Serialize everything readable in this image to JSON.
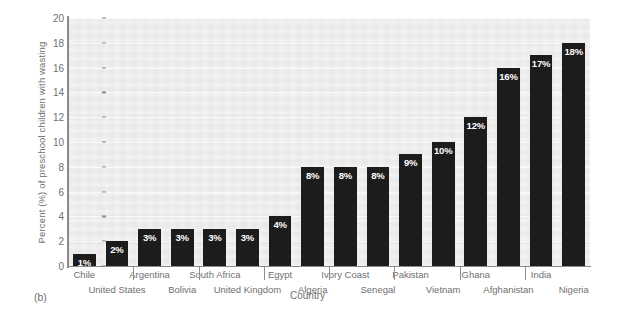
{
  "figure": {
    "caption": "(b)"
  },
  "chart_data": {
    "type": "bar",
    "title": "",
    "xlabel": "Country",
    "ylabel": "Percent (%) of preschool children with wasting",
    "ylim": [
      0,
      20
    ],
    "yticks": [
      0,
      2,
      4,
      6,
      8,
      10,
      12,
      14,
      16,
      18,
      20
    ],
    "grid": true,
    "legend": "none",
    "bar_color": "#1c1c1c",
    "value_label_color": "#ffffff",
    "plot_background": "#ececec",
    "categories": [
      "Chile",
      "United States",
      "Argentina",
      "Bolivia",
      "South Africa",
      "United Kingdom",
      "Egypt",
      "Algeria",
      "Ivory Coast",
      "Senegal",
      "Pakistan",
      "Vietnam",
      "Ghana",
      "Afghanistan",
      "India",
      "Nigeria"
    ],
    "values": [
      1,
      2,
      3,
      3,
      3,
      3,
      4,
      8,
      8,
      8,
      9,
      10,
      12,
      16,
      17,
      18
    ],
    "value_labels": [
      "1%",
      "2%",
      "3%",
      "3%",
      "3%",
      "3%",
      "4%",
      "8%",
      "8%",
      "8%",
      "9%",
      "10%",
      "12%",
      "16%",
      "17%",
      "18%"
    ]
  }
}
